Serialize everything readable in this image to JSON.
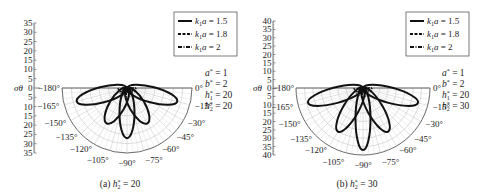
{
  "chart_data": [
    {
      "type": "polar",
      "panel": "a",
      "caption": "(a) h2* = 20",
      "caption_parts": {
        "prefix": "(a) ",
        "var": "h",
        "sup": "*",
        "sub": "2",
        "value": " = 20"
      },
      "radial_axis": {
        "label": "σθ",
        "ticks": [
          35,
          30,
          25,
          20,
          15,
          10,
          5,
          0,
          5,
          10,
          15,
          20,
          25,
          30,
          35
        ],
        "max": 35,
        "step": 5
      },
      "angle_ticks": [
        "−180°",
        "−165°",
        "−150°",
        "−135°",
        "−120°",
        "−105°",
        "−90°",
        "−75°",
        "−60°",
        "−45°",
        "−30°",
        "−15°",
        "0°"
      ],
      "legend": [
        {
          "label": "k1a = 1.5",
          "style": "solid"
        },
        {
          "label": "k1a = 1.8",
          "style": "dashed"
        },
        {
          "label": "k1a = 2",
          "style": "dashdot"
        }
      ],
      "params": [
        {
          "name": "a",
          "sub": "",
          "value": "1"
        },
        {
          "name": "b",
          "sub": "",
          "value": "2"
        },
        {
          "name": "h",
          "sub": "1",
          "value": "20"
        },
        {
          "name": "h",
          "sub": "2",
          "value": "20"
        }
      ],
      "series": [
        {
          "name": "k1a = 1.5",
          "lobes": [
            {
              "angle_deg": -165,
              "r": 28
            },
            {
              "angle_deg": -120,
              "r": 22
            },
            {
              "angle_deg": -90,
              "r": 27
            },
            {
              "angle_deg": -60,
              "r": 22
            },
            {
              "angle_deg": -15,
              "r": 28
            }
          ]
        },
        {
          "name": "k1a = 1.8",
          "lobes": [
            {
              "angle_deg": -90,
              "r": 3
            }
          ]
        },
        {
          "name": "k1a = 2",
          "lobes": [
            {
              "angle_deg": -90,
              "r": 2
            }
          ]
        }
      ]
    },
    {
      "type": "polar",
      "panel": "b",
      "caption": "(b) h2* = 30",
      "caption_parts": {
        "prefix": "(b) ",
        "var": "h",
        "sup": "*",
        "sub": "2",
        "value": " = 30"
      },
      "radial_axis": {
        "label": "σθ",
        "ticks": [
          40,
          35,
          30,
          25,
          20,
          15,
          10,
          5,
          0,
          5,
          10,
          15,
          20,
          25,
          30,
          35,
          40
        ],
        "max": 40,
        "step": 5
      },
      "angle_ticks": [
        "−180°",
        "−165°",
        "−150°",
        "−135°",
        "−120°",
        "−105°",
        "−90°",
        "−75°",
        "−60°",
        "−45°",
        "−30°",
        "−15°",
        "0°"
      ],
      "legend": [
        {
          "label": "k1a = 1.5",
          "style": "solid"
        },
        {
          "label": "k1a = 1.8",
          "style": "dashed"
        },
        {
          "label": "k1a = 2",
          "style": "dashdot"
        }
      ],
      "params": [
        {
          "name": "a",
          "sub": "",
          "value": "1"
        },
        {
          "name": "b",
          "sub": "",
          "value": "2"
        },
        {
          "name": "h",
          "sub": "1",
          "value": "20"
        },
        {
          "name": "h",
          "sub": "2",
          "value": "30"
        }
      ],
      "series": [
        {
          "name": "k1a = 1.5",
          "lobes": [
            {
              "angle_deg": -165,
              "r": 34
            },
            {
              "angle_deg": -120,
              "r": 30
            },
            {
              "angle_deg": -90,
              "r": 37
            },
            {
              "angle_deg": -60,
              "r": 30
            },
            {
              "angle_deg": -15,
              "r": 34
            }
          ]
        },
        {
          "name": "k1a = 1.8",
          "lobes": [
            {
              "angle_deg": -90,
              "r": 4
            }
          ]
        },
        {
          "name": "k1a = 2",
          "lobes": [
            {
              "angle_deg": -90,
              "r": 3
            }
          ]
        }
      ]
    }
  ]
}
